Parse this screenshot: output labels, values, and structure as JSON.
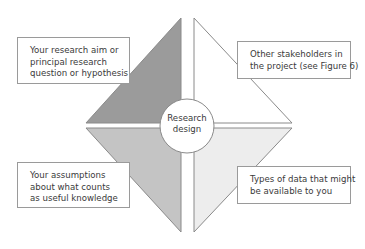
{
  "diagram": {
    "center": {
      "lines": [
        "Research",
        "design"
      ]
    },
    "quadrants": [
      {
        "position": "top-left",
        "fill": "#9b9b9b",
        "lines": [
          "Your research aim or",
          "principal research",
          "question or hypothesis"
        ]
      },
      {
        "position": "top-right",
        "fill": "#ffffff",
        "lines": [
          "Other stakeholders in",
          "the project (see Figure 6)"
        ]
      },
      {
        "position": "bottom-left",
        "fill": "#c4c4c4",
        "lines": [
          "Your assumptions",
          "about what counts",
          "as useful knowledge"
        ]
      },
      {
        "position": "bottom-right",
        "fill": "#ededed",
        "lines": [
          "Types of data that might",
          "be available to you"
        ]
      }
    ],
    "colors": {
      "stroke": "#8a8a8a",
      "box_border": "#9a9a9a",
      "text": "#3a3a3a",
      "background": "#ffffff"
    }
  }
}
